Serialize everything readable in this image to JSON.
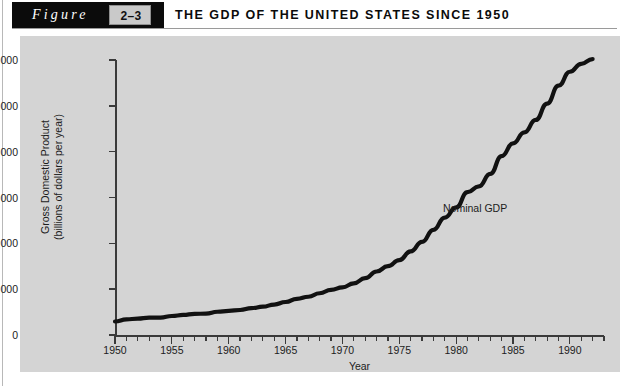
{
  "header": {
    "figure_word": "Figure",
    "figure_number": "2–3",
    "title": "THE GDP OF THE UNITED STATES SINCE 1950"
  },
  "chart_data": {
    "type": "line",
    "title": "THE GDP OF THE UNITED STATES SINCE 1950",
    "xlabel": "Year",
    "ylabel_line1": "Gross Domestic Product",
    "ylabel_line2": "(billions of dollars per year)",
    "xlim": [
      1950,
      1993
    ],
    "ylim": [
      0,
      6000
    ],
    "grid": false,
    "legend_position": "inline-annotation",
    "x_tick_labels": [
      "1950",
      "1955",
      "1960",
      "1965",
      "1970",
      "1975",
      "1980",
      "1985",
      "1990"
    ],
    "x_tick_label_values": [
      1950,
      1955,
      1960,
      1965,
      1970,
      1975,
      1980,
      1985,
      1990
    ],
    "x_minor_tick_step": 1,
    "y_tick_labels": [
      "0",
      "1,000",
      "2,000",
      "3,000",
      "4,000",
      "5,000",
      "6,000"
    ],
    "y_tick_values": [
      0,
      1000,
      2000,
      3000,
      4000,
      5000,
      6000
    ],
    "series": [
      {
        "name": "Nominal GDP",
        "annotation": "Nominal GDP",
        "color": "#111111",
        "x": [
          1950,
          1951,
          1952,
          1953,
          1954,
          1955,
          1956,
          1957,
          1958,
          1959,
          1960,
          1961,
          1962,
          1963,
          1964,
          1965,
          1966,
          1967,
          1968,
          1969,
          1970,
          1971,
          1972,
          1973,
          1974,
          1975,
          1976,
          1977,
          1978,
          1979,
          1980,
          1981,
          1982,
          1983,
          1984,
          1985,
          1986,
          1987,
          1988,
          1989,
          1990,
          1991,
          1992
        ],
        "values": [
          294,
          339,
          358,
          379,
          380,
          414,
          437,
          461,
          467,
          507,
          527,
          545,
          586,
          618,
          664,
          720,
          789,
          834,
          911,
          985,
          1039,
          1128,
          1240,
          1385,
          1501,
          1635,
          1824,
          2031,
          2295,
          2563,
          2784,
          3116,
          3242,
          3515,
          3903,
          4181,
          4422,
          4692,
          5049,
          5439,
          5744,
          5917,
          6020
        ]
      }
    ]
  }
}
